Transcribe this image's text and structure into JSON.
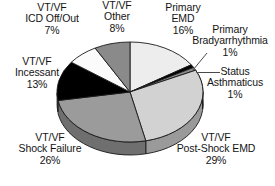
{
  "chart_data": {
    "type": "pie",
    "title": "",
    "subtitle": "",
    "xlabel": "",
    "ylabel": "",
    "legend_position": "none",
    "grid": false,
    "style": "3d-exploded-none",
    "start_angle_deg": 0,
    "direction": "clockwise",
    "unit": "%",
    "categories": [
      "Primary EMD",
      "Primary Bradyarrhythmia",
      "Status Asthmaticus",
      "VT/VF Post-Shock EMD",
      "VT/VF Shock Failure",
      "VT/VF Incessant",
      "VT/VF ICD Off/Out",
      "VT/VF Other"
    ],
    "values": [
      16,
      1,
      1,
      29,
      26,
      13,
      7,
      8
    ],
    "slice_colors": [
      "#ededed",
      "#000000",
      "#8a8a8a",
      "#d2d2d2",
      "#9b9b9b",
      "#000000",
      "#fbfbfb",
      "#8a8a8a"
    ],
    "side_colors": [
      "#b4b4b4",
      "#000000",
      "#5e5e5e",
      "#9a9a9a",
      "#6f6f6f",
      "#000000",
      "#c4c4c4",
      "#5e5e5e"
    ],
    "slices": [
      {
        "label": "Primary EMD",
        "value": 16,
        "value_text": "16%",
        "color": "#ededed"
      },
      {
        "label": "Primary Bradyarrhythmia",
        "value": 1,
        "value_text": "1%",
        "color": "#000000"
      },
      {
        "label": "Status Asthmaticus",
        "value": 1,
        "value_text": "1%",
        "color": "#8a8a8a"
      },
      {
        "label": "VT/VF Post-Shock EMD",
        "value": 29,
        "value_text": "29%",
        "color": "#d2d2d2"
      },
      {
        "label": "VT/VF Shock Failure",
        "value": 26,
        "value_text": "26%",
        "color": "#9b9b9b"
      },
      {
        "label": "VT/VF Incessant",
        "value": 13,
        "value_text": "13%",
        "color": "#000000"
      },
      {
        "label": "VT/VF ICD Off/Out",
        "value": 7,
        "value_text": "7%",
        "color": "#fbfbfb"
      },
      {
        "label": "VT/VF Other",
        "value": 8,
        "value_text": "8%",
        "color": "#8a8a8a"
      }
    ]
  },
  "labels": {
    "icd": {
      "line1": "VT/VF",
      "line2": "ICD Off/Out",
      "pct": "7%"
    },
    "other": {
      "line1": "VT/VF",
      "line2": "Other",
      "pct": "8%"
    },
    "primary_emd": {
      "line1": "Primary",
      "line2": "EMD",
      "pct": "16%"
    },
    "brady": {
      "line1": "Primary",
      "line2": "Bradyarrhythmia",
      "pct": "1%"
    },
    "status": {
      "line1": "Status",
      "line2": "Asthmaticus",
      "pct": "1%"
    },
    "incessant": {
      "line1": "VT/VF",
      "line2": "Incessant",
      "pct": "13%"
    },
    "shock_failure": {
      "line1": "VT/VF",
      "line2": "Shock Failure",
      "pct": "26%"
    },
    "post_shock_emd": {
      "line1": "VT/VF",
      "line2": "Post-Shock EMD",
      "pct": "29%"
    }
  },
  "colors": {
    "background": "#ffffff",
    "text": "#141414",
    "outline": "#1a1a1a",
    "leader_line": "#4a4a4a"
  }
}
